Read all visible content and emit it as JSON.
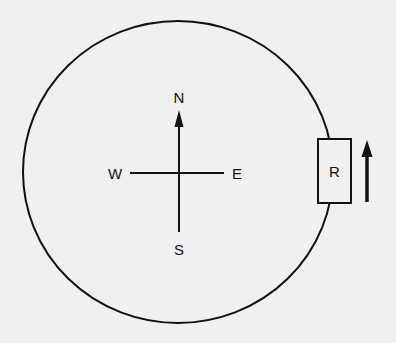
{
  "diagram": {
    "type": "circular-track-with-compass",
    "compass": {
      "north": "N",
      "south": "S",
      "east": "E",
      "west": "W"
    },
    "object": {
      "label": "R",
      "position": "east side of circle",
      "motion_arrow": "up (north)"
    },
    "colors": {
      "background": "#f0f0f0",
      "stroke": "#111111"
    }
  }
}
